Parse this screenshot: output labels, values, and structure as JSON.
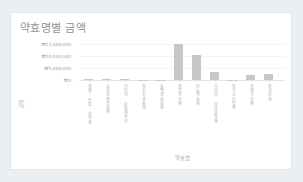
{
  "card": {
    "title": "약효명별 금액"
  },
  "chart_data": {
    "type": "bar",
    "title": "약효명별 금액",
    "xlabel": "약효명",
    "ylabel": "금액",
    "ylim": [
      0,
      16500000
    ],
    "grid": true,
    "legend": "none",
    "currency_symbol": "₩",
    "ytick_labels": [
      "₩15,000,000",
      "₩10,000,000",
      "₩5,000,000",
      "₩0"
    ],
    "ytick_values": [
      15000000,
      10000000,
      5000000,
      0
    ],
    "categories": [
      "해열.진통.소염제",
      "소화성궤양용제",
      "기타의 순환계용약",
      "정신신경용제",
      "동맥경화용제",
      "혈압강하제",
      "당뇨병용제",
      "기타의 화학요법제",
      "항히스타민제",
      "진해거담제",
      "안과용제"
    ],
    "values": [
      420000,
      260000,
      520000,
      90000,
      140000,
      15200000,
      10500000,
      3500000,
      120000,
      2100000,
      2600000
    ],
    "bar_color": "#c4c8cb"
  }
}
